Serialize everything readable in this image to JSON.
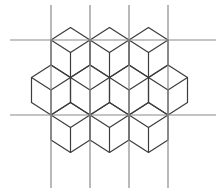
{
  "diagram": {
    "title": "",
    "colors": {
      "background": "#ffffff",
      "grid_line": "#8a8a8a",
      "cube_edge": "#3c3c3c"
    },
    "grid": {
      "vertical_lines": [
        {
          "x": 51,
          "y1": 5,
          "y2": 188
        },
        {
          "x": 90,
          "y1": 5,
          "y2": 188
        },
        {
          "x": 129,
          "y1": 5,
          "y2": 188
        },
        {
          "x": 168,
          "y1": 5,
          "y2": 188
        }
      ],
      "horizontal_lines": [
        {
          "y": 40,
          "x1": 10,
          "x2": 216
        },
        {
          "y": 115,
          "x1": 10,
          "x2": 216
        }
      ]
    },
    "cube_geometry": {
      "half_width": 19.5,
      "half_height": 12.5,
      "edge": 25
    },
    "cubes": [
      {
        "row": 1,
        "cx": 70.5,
        "cy": 40
      },
      {
        "row": 1,
        "cx": 109.5,
        "cy": 40
      },
      {
        "row": 1,
        "cx": 148.5,
        "cy": 40
      },
      {
        "row": 2,
        "cx": 51,
        "cy": 77.5
      },
      {
        "row": 2,
        "cx": 90,
        "cy": 77.5
      },
      {
        "row": 2,
        "cx": 129,
        "cy": 77.5
      },
      {
        "row": 2,
        "cx": 168,
        "cy": 77.5
      },
      {
        "row": 3,
        "cx": 70.5,
        "cy": 115
      },
      {
        "row": 3,
        "cx": 109.5,
        "cy": 115
      },
      {
        "row": 3,
        "cx": 148.5,
        "cy": 115
      }
    ]
  }
}
